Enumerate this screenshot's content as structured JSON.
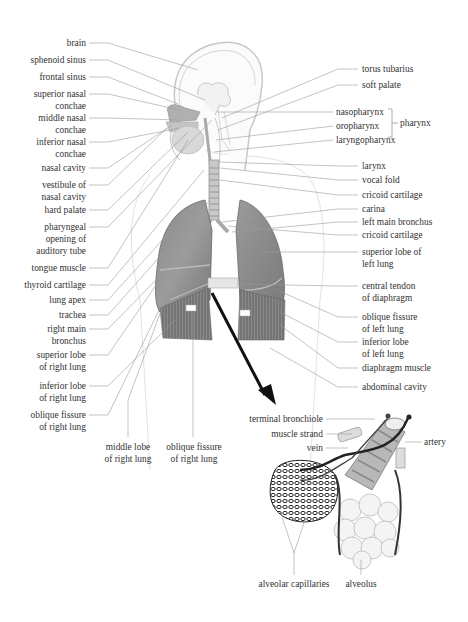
{
  "diagram": {
    "left_labels": [
      {
        "id": "brain",
        "lines": [
          "brain"
        ],
        "x": 86,
        "y": 37
      },
      {
        "id": "sphenoid-sinus",
        "lines": [
          "sphenoid sinus"
        ],
        "x": 86,
        "y": 54
      },
      {
        "id": "frontal-sinus",
        "lines": [
          "frontal sinus"
        ],
        "x": 86,
        "y": 71
      },
      {
        "id": "superior-nasal-conchae",
        "lines": [
          "superior nasal",
          "conchae"
        ],
        "x": 86,
        "y": 88
      },
      {
        "id": "middle-nasal-conchae",
        "lines": [
          "middle nasal",
          "conchae"
        ],
        "x": 86,
        "y": 112
      },
      {
        "id": "inferior-nasal-conchae",
        "lines": [
          "inferior nasal",
          "conchae"
        ],
        "x": 86,
        "y": 136
      },
      {
        "id": "nasal-cavity",
        "lines": [
          "nasal cavity"
        ],
        "x": 86,
        "y": 162
      },
      {
        "id": "vestibule-of-nasal-cavity",
        "lines": [
          "vestibule of",
          "nasal cavity"
        ],
        "x": 86,
        "y": 179
      },
      {
        "id": "hard-palate",
        "lines": [
          "hard palate"
        ],
        "x": 86,
        "y": 204
      },
      {
        "id": "pharyngeal-opening",
        "lines": [
          "pharyngeal",
          "opening of",
          "auditory tube"
        ],
        "x": 86,
        "y": 221
      },
      {
        "id": "tongue-muscle",
        "lines": [
          "tongue muscle"
        ],
        "x": 86,
        "y": 262
      },
      {
        "id": "thyroid-cartilage",
        "lines": [
          "thyroid cartilage"
        ],
        "x": 86,
        "y": 279
      },
      {
        "id": "lung-apex",
        "lines": [
          "lung apex"
        ],
        "x": 86,
        "y": 294
      },
      {
        "id": "trachea",
        "lines": [
          "trachea"
        ],
        "x": 86,
        "y": 309
      },
      {
        "id": "right-main-bronchus",
        "lines": [
          "right main",
          "bronchus"
        ],
        "x": 86,
        "y": 323
      },
      {
        "id": "superior-lobe-right",
        "lines": [
          "superior lobe",
          "of right lung"
        ],
        "x": 86,
        "y": 349
      },
      {
        "id": "inferior-lobe-right",
        "lines": [
          "inferior lobe",
          "of right lung"
        ],
        "x": 86,
        "y": 380
      },
      {
        "id": "oblique-fissure-right",
        "lines": [
          "oblique fissure",
          "of right lung"
        ],
        "x": 86,
        "y": 409
      }
    ],
    "bottom_labels": [
      {
        "id": "middle-lobe-right",
        "lines": [
          "middle lobe",
          "of right lung"
        ],
        "x": 128,
        "y": 441
      },
      {
        "id": "oblique-fissure-right-2",
        "lines": [
          "oblique fissure",
          "of right lung"
        ],
        "x": 193,
        "y": 441
      }
    ],
    "right_labels": [
      {
        "id": "torus-tubarius",
        "lines": [
          "torus tubarius"
        ],
        "x": 362,
        "y": 63
      },
      {
        "id": "soft-palate",
        "lines": [
          "soft palate"
        ],
        "x": 362,
        "y": 79
      },
      {
        "id": "nasopharynx",
        "lines": [
          "nasopharynx"
        ],
        "x": 336,
        "y": 106
      },
      {
        "id": "oropharynx",
        "lines": [
          "oropharynx"
        ],
        "x": 336,
        "y": 120
      },
      {
        "id": "laryngopharynx",
        "lines": [
          "laryngopharynx"
        ],
        "x": 336,
        "y": 134
      },
      {
        "id": "larynx",
        "lines": [
          "larynx"
        ],
        "x": 362,
        "y": 160
      },
      {
        "id": "vocal-fold",
        "lines": [
          "vocal fold"
        ],
        "x": 362,
        "y": 174
      },
      {
        "id": "cricoid-cartilage",
        "lines": [
          "cricoid cartilage"
        ],
        "x": 362,
        "y": 189
      },
      {
        "id": "carina",
        "lines": [
          "carina"
        ],
        "x": 362,
        "y": 203
      },
      {
        "id": "left-main-bronchus",
        "lines": [
          "left main bronchus"
        ],
        "x": 362,
        "y": 216
      },
      {
        "id": "cricoid-cartilage-2",
        "lines": [
          "cricoid cartilage"
        ],
        "x": 362,
        "y": 229
      },
      {
        "id": "superior-lobe-left",
        "lines": [
          "superior lobe of",
          "left lung"
        ],
        "x": 362,
        "y": 246
      },
      {
        "id": "central-tendon",
        "lines": [
          "central tendon",
          "of diaphragm"
        ],
        "x": 362,
        "y": 280
      },
      {
        "id": "oblique-fissure-left",
        "lines": [
          "oblique fissure",
          "of left lung"
        ],
        "x": 362,
        "y": 311
      },
      {
        "id": "inferior-lobe-left",
        "lines": [
          "inferior lobe",
          "of left lung"
        ],
        "x": 362,
        "y": 336
      },
      {
        "id": "diaphragm-muscle",
        "lines": [
          "diaphragm muscle"
        ],
        "x": 362,
        "y": 362
      },
      {
        "id": "abdominal-cavity",
        "lines": [
          "abdominal cavity"
        ],
        "x": 362,
        "y": 381
      }
    ],
    "group_label": {
      "id": "pharynx",
      "text": "pharynx",
      "x": 400,
      "y": 120
    },
    "inset_labels": [
      {
        "id": "terminal-bronchiole",
        "lines": [
          "terminal bronchiole"
        ],
        "x": 323,
        "y": 413,
        "align": "r"
      },
      {
        "id": "muscle-strand",
        "lines": [
          "muscle strand"
        ],
        "x": 323,
        "y": 428,
        "align": "r"
      },
      {
        "id": "vein",
        "lines": [
          "vein"
        ],
        "x": 323,
        "y": 442,
        "align": "r"
      },
      {
        "id": "artery",
        "lines": [
          "artery"
        ],
        "x": 424,
        "y": 436,
        "align": "l"
      },
      {
        "id": "alveolar-capillaries",
        "lines": [
          "alveolar capillaries"
        ],
        "x": 294,
        "y": 578,
        "align": "c"
      },
      {
        "id": "alveolus",
        "lines": [
          "alveolus"
        ],
        "x": 361,
        "y": 578,
        "align": "c"
      }
    ]
  }
}
